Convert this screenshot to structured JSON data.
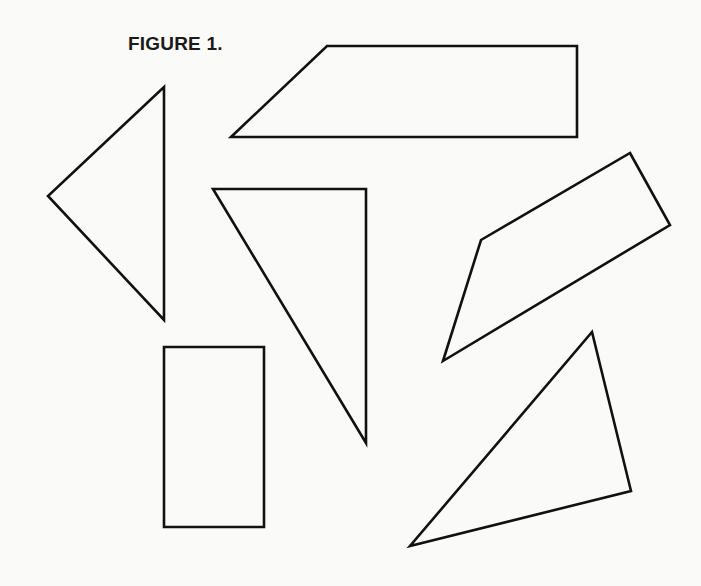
{
  "figure": {
    "title": "FIGURE 1.",
    "stroke_color": "#111111",
    "background_color": "#fafaf8"
  },
  "shapes": [
    {
      "name": "trapezoid-top",
      "kind": "trapezoid",
      "points": "327,46 577,46 577,137 231,137"
    },
    {
      "name": "triangle-left",
      "kind": "triangle",
      "points": "164,87 164,320 48,196"
    },
    {
      "name": "triangle-center",
      "kind": "right-triangle",
      "points": "213,189 366,189 366,443"
    },
    {
      "name": "rectangle-bottom-left",
      "kind": "rectangle",
      "points": "164,347 264,347 264,527 164,527"
    },
    {
      "name": "quadrilateral-right",
      "kind": "quadrilateral",
      "points": "630,153 670,225 443,361 481,240"
    },
    {
      "name": "triangle-bottom-right",
      "kind": "triangle",
      "points": "592,332 631,491 410,546"
    }
  ]
}
